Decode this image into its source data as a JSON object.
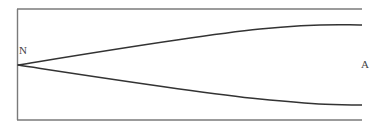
{
  "diagram": {
    "type": "flow-field-schematic",
    "labels": {
      "left_point": "N",
      "right_point": "A"
    },
    "colors": {
      "border": "#7a7a7a",
      "curves": "#333333",
      "label": "#444444",
      "background": "#ffffff"
    },
    "geometry": {
      "frame": {
        "left": 17,
        "top": 9,
        "right": 362,
        "bottom": 120,
        "right_side_open": true
      },
      "vertex": {
        "x": 18,
        "y": 65
      },
      "upper_curve_points": [
        [
          18,
          65
        ],
        [
          150,
          43
        ],
        [
          230,
          33
        ],
        [
          260,
          29
        ],
        [
          362,
          25
        ]
      ],
      "lower_curve_points": [
        [
          18,
          65
        ],
        [
          150,
          84
        ],
        [
          230,
          97
        ],
        [
          260,
          99
        ],
        [
          362,
          105
        ]
      ]
    }
  }
}
